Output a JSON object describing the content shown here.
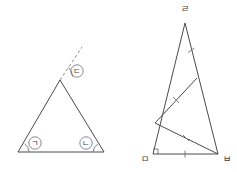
{
  "figure": {
    "stroke_color": "#4a4a4a",
    "dashed_color": "#8a8a8a",
    "mark_color": "#6f6f6f",
    "background": "#ffffff"
  },
  "left_figure": {
    "name": "triangle-with-exterior-angle",
    "vertices": {
      "apex": {
        "x": 60,
        "y": 80
      },
      "bottom_left": {
        "x": 18,
        "y": 152
      },
      "bottom_right": {
        "x": 104,
        "y": 152
      }
    },
    "dashed_extension": {
      "from_x": 60,
      "from_y": 80,
      "to_x": 82,
      "to_y": 47
    },
    "angle_labels": [
      {
        "id": "angle-bottom-left",
        "text": "ㄱ",
        "cx": 35,
        "cy": 143
      },
      {
        "id": "angle-bottom-right",
        "text": "ㄴ",
        "cx": 86,
        "cy": 143
      },
      {
        "id": "angle-exterior-apex",
        "text": "ㄷ",
        "cx": 77,
        "cy": 71
      }
    ],
    "label_circle_radius": 6.2
  },
  "right_figure": {
    "name": "tall-triangle-with-cevians",
    "vertices": {
      "top": {
        "x": 185,
        "y": 23,
        "label": "ㄹ",
        "label_x": 185,
        "label_y": 9
      },
      "bottom_left": {
        "x": 153,
        "y": 154,
        "label": "ㅁ",
        "label_x": 145,
        "label_y": 159
      },
      "bottom_right": {
        "x": 218,
        "y": 154,
        "label": "ㅂ",
        "label_x": 227,
        "label_y": 159
      }
    },
    "interior_points": {
      "on_left_side": {
        "x": 155,
        "y": 123
      },
      "on_right_side": {
        "x": 197,
        "y": 78
      }
    },
    "cevians": [
      {
        "id": "cevian-left-to-right-side",
        "x1": 155,
        "y1": 123,
        "x2": 197,
        "y2": 78
      },
      {
        "id": "cevian-left-to-bottom-right",
        "x1": 155,
        "y1": 123,
        "x2": 218,
        "y2": 154
      }
    ],
    "tick_marks": [
      {
        "id": "tick-upper-right-side",
        "x": 191,
        "y": 50
      },
      {
        "id": "tick-cevian-upper",
        "x": 176,
        "y": 100
      },
      {
        "id": "tick-cevian-lower",
        "x": 186,
        "y": 138
      },
      {
        "id": "tick-baseline",
        "x": 185,
        "y": 154
      }
    ],
    "right_angle_marker": {
      "x": 153,
      "y": 154,
      "size": 5
    }
  }
}
